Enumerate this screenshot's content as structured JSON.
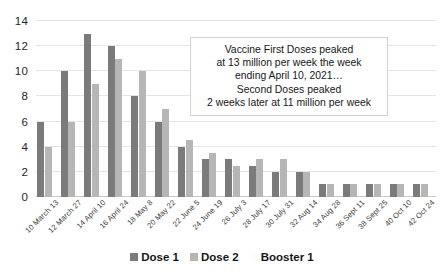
{
  "chart_data": {
    "type": "bar",
    "title": "",
    "xlabel": "",
    "ylabel": "",
    "ylim": [
      0,
      14
    ],
    "yticks": [
      0,
      2,
      4,
      6,
      8,
      10,
      12,
      14
    ],
    "grid": true,
    "legend_position": "bottom",
    "categories": [
      "10 March 13",
      "12 March 27",
      "14 April 10",
      "16 April 24",
      "18 May 8",
      "20 May 22",
      "22 June 5",
      "24 June 19",
      "26 July 3",
      "28 July 17",
      "30 July 31",
      "32 Aug 14",
      "34 Aug 28",
      "36 Sept 11",
      "38 Sept 25",
      "40 Oct 10",
      "42 Oct 24"
    ],
    "series": [
      {
        "name": "Dose 1",
        "color": "#7b7b7b",
        "values": [
          6,
          10,
          13,
          12,
          8,
          6,
          4,
          3,
          3,
          2.5,
          2,
          2,
          1,
          1,
          1,
          1,
          1
        ]
      },
      {
        "name": "Dose 2",
        "color": "#b6b6b6",
        "values": [
          4,
          6,
          9,
          11,
          10,
          7,
          4.5,
          3.5,
          2.5,
          3,
          3,
          2,
          1,
          1,
          1,
          1,
          1
        ]
      },
      {
        "name": "Booster 1",
        "color": "#f2f2f2",
        "values": [
          0,
          0,
          0,
          0,
          0,
          0,
          0,
          0,
          0,
          0,
          0,
          0,
          0,
          0,
          0,
          0,
          0
        ]
      }
    ],
    "annotations": [
      {
        "name": "peak-callout",
        "lines": [
          "Vaccine First Doses peaked",
          "at 13 million per week the week",
          "ending April 10, 2021…",
          "Second Doses peaked",
          "2 weeks later at 11 million per week"
        ]
      }
    ]
  },
  "legend": {
    "items": [
      {
        "label": "Dose 1",
        "color": "#7b7b7b"
      },
      {
        "label": "Dose 2",
        "color": "#b6b6b6"
      },
      {
        "label": "Booster 1",
        "color": "#fdfdfd"
      }
    ]
  }
}
